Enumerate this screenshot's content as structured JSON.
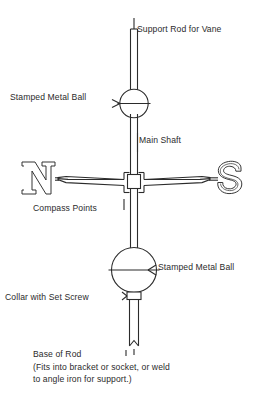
{
  "diagram": {
    "colors": {
      "stroke": "#2b2b2b",
      "text": "#2b2b2b",
      "background": "#ffffff"
    },
    "labels": {
      "support_rod": "Support Rod for Vane",
      "stamped_metal_ball_top": "Stamped Metal Ball",
      "main_shaft": "Main Shaft",
      "compass_points": "Compass Points",
      "stamped_metal_ball_bottom": "Stamped Metal Ball",
      "collar_with_set_screw": "Collar with Set Screw",
      "base_of_rod": "Base of Rod",
      "base_of_rod_note_line1": "(Fits into bracket or socket, or weld",
      "base_of_rod_note_line2": "to angle iron for support.)"
    },
    "compass": {
      "north_letter": "N",
      "south_letter": "S"
    },
    "parts": [
      {
        "name": "support-rod",
        "kind": "rod"
      },
      {
        "name": "stamped-metal-ball-top",
        "kind": "sphere"
      },
      {
        "name": "main-shaft",
        "kind": "rod"
      },
      {
        "name": "compass-point-arms",
        "kind": "tapered-arms"
      },
      {
        "name": "center-collar",
        "kind": "sleeve"
      },
      {
        "name": "stamped-metal-ball-bottom",
        "kind": "sphere"
      },
      {
        "name": "collar-set-screw",
        "kind": "sleeve"
      },
      {
        "name": "base-rod",
        "kind": "rod-notched"
      }
    ]
  }
}
